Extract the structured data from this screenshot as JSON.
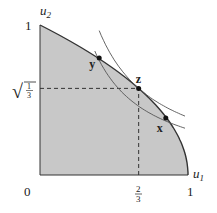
{
  "diagram": {
    "type": "utility-possibility-set",
    "axes": {
      "x_label": "u",
      "x_sub": "1",
      "y_label": "u",
      "y_sub": "2",
      "origin_label": "0",
      "x_max_label": "1",
      "y_max_label": "1",
      "x_tick_label": {
        "num": "2",
        "den": "3"
      },
      "y_tick_label": {
        "radical": "√",
        "num": "1",
        "den": "3"
      }
    },
    "frontier": {
      "equation": "u1 = 1 - u2^2",
      "fill_color": "#c8c8c8",
      "stroke_color": "#333333"
    },
    "points": [
      {
        "id": "y",
        "label": "y",
        "u1": 0.4,
        "u2": 0.78
      },
      {
        "id": "z",
        "label": "z",
        "u1": 0.6667,
        "u2": 0.5774
      },
      {
        "id": "x",
        "label": "x",
        "u1": 0.85,
        "u2": 0.38
      }
    ],
    "curves": [
      {
        "name": "outer-level-curve",
        "through": "z"
      },
      {
        "name": "inner-level-curve",
        "through": [
          "y",
          "x"
        ]
      }
    ],
    "guides": {
      "dashed_x": 0.6667,
      "dashed_y": 0.5774
    }
  }
}
